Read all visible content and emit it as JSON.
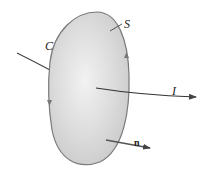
{
  "diagram": {
    "labels": {
      "surface": "S",
      "curve": "C",
      "current": "I",
      "normal": "n"
    },
    "colors": {
      "surface_fill": "#d9d9d9",
      "surface_edge": "#7a7a7a",
      "arrows": "#444444",
      "text": "#222222"
    }
  }
}
